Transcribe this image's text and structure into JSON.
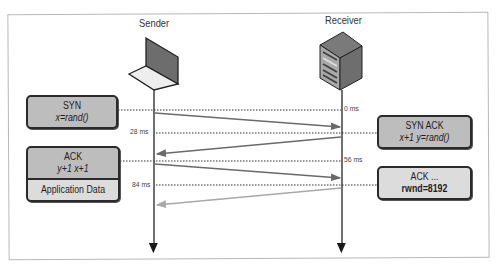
{
  "diagram": {
    "title_nodes": {
      "sender": {
        "label": "Sender",
        "icon": "laptop-icon"
      },
      "receiver": {
        "label": "Receiver",
        "icon": "server-icon"
      }
    },
    "timestamps": [
      {
        "label": "0 ms",
        "side": "receiver"
      },
      {
        "label": "28 ms",
        "side": "sender"
      },
      {
        "label": "56 ms",
        "side": "receiver"
      },
      {
        "label": "84 ms",
        "side": "sender"
      }
    ],
    "messages": [
      {
        "id": "syn",
        "direction": "sender-to-receiver",
        "line1": "SYN",
        "line2": "x=rand()"
      },
      {
        "id": "syn-ack",
        "direction": "receiver-to-sender",
        "line1": "SYN ACK",
        "line2": "x+1  y=rand()"
      },
      {
        "id": "ack",
        "direction": "sender-to-receiver",
        "line1": "ACK",
        "line2": "y+1  x+1"
      },
      {
        "id": "app-data",
        "direction": "sender-to-receiver",
        "line1": "Application Data"
      },
      {
        "id": "ack-rwnd",
        "direction": "receiver-to-sender",
        "line1": "ACK ...",
        "line2": "rwnd=8192"
      }
    ],
    "colors": {
      "box_fill_dark": "#bdbdbd",
      "box_fill_light": "#dcdcdc",
      "arrow_dark": "#666666",
      "arrow_light": "#aaaaaa",
      "lifeline": "#222222"
    }
  }
}
